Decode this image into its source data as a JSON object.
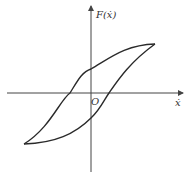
{
  "diagram": {
    "type": "hysteresis-loop",
    "y_axis_label": "F(ẋ)",
    "x_axis_label": "ẋ",
    "origin_label": "O",
    "colors": {
      "line": "#2a2a2a",
      "axis": "#444444",
      "background": "#ffffff"
    }
  }
}
